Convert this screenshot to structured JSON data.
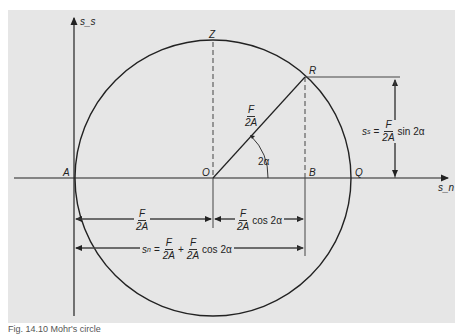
{
  "figure": {
    "background": "#e6e6e6",
    "line_color": "#222222",
    "axes": {
      "vertical_label": "s_s",
      "horizontal_label": "s_n"
    },
    "points": {
      "A": "A",
      "O": "O",
      "B": "B",
      "Q": "Q",
      "Z": "Z",
      "R": "R"
    },
    "radius_label": {
      "num": "F",
      "den": "2A"
    },
    "angle_label": "2α",
    "shear_eq": {
      "lhs": "s",
      "lhs_sub": "s",
      "eq": "=",
      "num": "F",
      "den": "2A",
      "tail": "sin 2α"
    },
    "dim_OA": {
      "num": "F",
      "den": "2A"
    },
    "dim_OB": {
      "num": "F",
      "den": "2A",
      "tail": "cos 2α"
    },
    "normal_eq": {
      "lhs": "s",
      "lhs_sub": "n",
      "eq": "=",
      "num1": "F",
      "den1": "2A",
      "plus": "+",
      "num2": "F",
      "den2": "2A",
      "tail": "cos 2α"
    },
    "caption": "Fig. 14.10 Mohr's circle"
  }
}
